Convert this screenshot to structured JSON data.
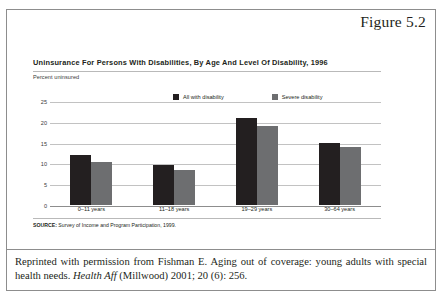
{
  "figure": {
    "label": "Figure 5.2"
  },
  "chart_data": {
    "type": "bar",
    "title": "Uninsurance For Persons With Disabilities, By Age And Level Of Disability, 1996",
    "ylabel": "Percent uninsured",
    "xlabel": "",
    "ylim": [
      0,
      25
    ],
    "yticks": [
      "25",
      "20",
      "15",
      "10",
      "5",
      "0"
    ],
    "ytick_values": [
      25,
      20,
      15,
      10,
      5,
      0
    ],
    "grid": true,
    "legend_position": "top-center",
    "categories": [
      "0–11 years",
      "11–18 years",
      "19–29 years",
      "30–64 years"
    ],
    "series": [
      {
        "name": "All with disability",
        "color": "#231f20",
        "values": [
          12.0,
          9.5,
          20.8,
          15.0
        ]
      },
      {
        "name": "Severe disability",
        "color": "#6d6e70",
        "values": [
          10.3,
          8.5,
          19.0,
          14.0
        ]
      }
    ],
    "source_label": "SOURCE:",
    "source_text": " Survey of Income and Program Participation, 1999."
  },
  "caption": {
    "part1": "Reprinted with permission from Fishman E. Aging out of coverage: young adults with special health needs. ",
    "italic": "Health Aff",
    "part2": " (Millwood) 2001; 20 (6): 256."
  }
}
